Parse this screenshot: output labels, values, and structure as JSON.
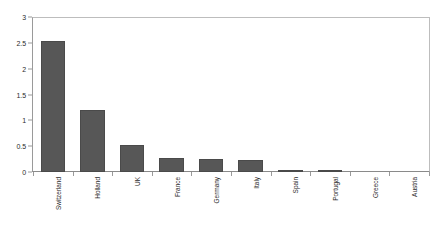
{
  "chart_data": {
    "type": "bar",
    "title": "",
    "xlabel": "",
    "ylabel": "",
    "categories": [
      "Switzerland",
      "Holland",
      "UK",
      "France",
      "Germany",
      "Italy",
      "Spain",
      "Portugal",
      "Greece",
      "Austria"
    ],
    "values": [
      2.55,
      1.2,
      0.52,
      0.27,
      0.26,
      0.23,
      0.03,
      0.04,
      0.0,
      0.0
    ],
    "ylim": [
      0,
      3
    ],
    "ytick_labels": [
      "0",
      "0.5",
      "1",
      "1.5",
      "2",
      "2.5",
      "3"
    ],
    "ytick_values": [
      0,
      0.5,
      1,
      1.5,
      2,
      2.5,
      3
    ],
    "grid": false,
    "legend": null,
    "bar_color": "#575757",
    "axis_color": "#9a9a9a",
    "frame_color": "#bdbdbd",
    "text_color": "#2b2b2b"
  }
}
